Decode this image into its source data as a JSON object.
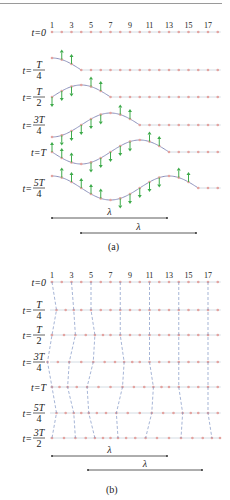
{
  "colors": {
    "axis": "#c9d3dc",
    "dot": "#e3a3a0",
    "curve": "#8e93bd",
    "arrow": "#3daa4a",
    "dash": "#7f95c4",
    "text": "#222222",
    "scale": "#333333"
  },
  "point_labels": [
    "1",
    "3",
    "5",
    "7",
    "9",
    "11",
    "13",
    "15",
    "17"
  ],
  "panel_a": {
    "caption": "(a)",
    "rows": [
      {
        "label": "t=0",
        "num": "",
        "den": "",
        "y": 32,
        "phase": 0
      },
      {
        "label": "t=",
        "num": "T",
        "den": "4",
        "y": 70,
        "phase": 1
      },
      {
        "label": "t=",
        "num": "T",
        "den": "2",
        "y": 97,
        "phase": 2
      },
      {
        "label": "t=",
        "num": "3T",
        "den": "4",
        "y": 125,
        "phase": 3
      },
      {
        "label": "t=T",
        "num": "",
        "den": "",
        "y": 152,
        "phase": 4
      },
      {
        "label": "t=",
        "num": "5T",
        "den": "4",
        "y": 188,
        "phase": 5
      }
    ],
    "wavelengths": [
      {
        "label": "λ",
        "x1": 52,
        "x2": 167,
        "y": 218
      },
      {
        "label": "λ",
        "x1": 81,
        "x2": 196,
        "y": 233
      }
    ]
  },
  "panel_b": {
    "caption": "(b)",
    "rows": [
      {
        "label": "t=0",
        "num": "",
        "den": "",
        "y": 282,
        "phase": 0
      },
      {
        "label": "t=",
        "num": "T",
        "den": "4",
        "y": 310,
        "phase": 1
      },
      {
        "label": "t=",
        "num": "T",
        "den": "2",
        "y": 335,
        "phase": 2
      },
      {
        "label": "t=",
        "num": "3T",
        "den": "4",
        "y": 362,
        "phase": 3
      },
      {
        "label": "t=T",
        "num": "",
        "den": "",
        "y": 387,
        "phase": 4
      },
      {
        "label": "t=",
        "num": "5T",
        "den": "4",
        "y": 413,
        "phase": 5
      },
      {
        "label": "t=",
        "num": "3T",
        "den": "2",
        "y": 438,
        "phase": 6
      }
    ],
    "wavelengths": [
      {
        "label": "λ",
        "x1": 52,
        "x2": 167,
        "y": 456
      },
      {
        "label": "λ",
        "x1": 88,
        "x2": 202,
        "y": 470
      }
    ]
  }
}
